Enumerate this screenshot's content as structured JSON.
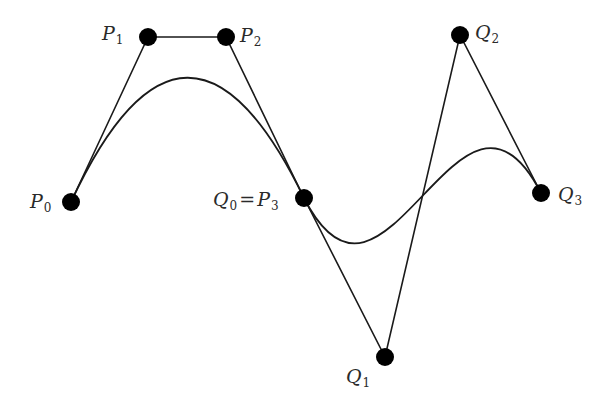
{
  "diagram": {
    "type": "composite-bezier-curve",
    "stroke_color": "#1a1a1a",
    "point_color": "#000000",
    "point_radius": 9,
    "curve_P": {
      "name": "P",
      "control_points": [
        {
          "id": "P0",
          "letter": "P",
          "sub": "0",
          "x": 71,
          "y": 202
        },
        {
          "id": "P1",
          "letter": "P",
          "sub": "1",
          "x": 148,
          "y": 37
        },
        {
          "id": "P2",
          "letter": "P",
          "sub": "2",
          "x": 226,
          "y": 37
        },
        {
          "id": "P3",
          "letter": "P",
          "sub": "3",
          "x": 304,
          "y": 198
        }
      ]
    },
    "curve_Q": {
      "name": "Q",
      "control_points": [
        {
          "id": "Q0",
          "letter": "Q",
          "sub": "0",
          "x": 304,
          "y": 198
        },
        {
          "id": "Q1",
          "letter": "Q",
          "sub": "1",
          "x": 385,
          "y": 357
        },
        {
          "id": "Q2",
          "letter": "Q",
          "sub": "2",
          "x": 460,
          "y": 35
        },
        {
          "id": "Q3",
          "letter": "Q",
          "sub": "3",
          "x": 541,
          "y": 193
        }
      ]
    },
    "labels": {
      "P0": {
        "letter": "P",
        "sub": "0"
      },
      "P1": {
        "letter": "P",
        "sub": "1"
      },
      "P2": {
        "letter": "P",
        "sub": "2"
      },
      "Q0P3": {
        "letter_a": "Q",
        "sub_a": "0",
        "eq": "=",
        "letter_b": "P",
        "sub_b": "3"
      },
      "Q1": {
        "letter": "Q",
        "sub": "1"
      },
      "Q2": {
        "letter": "Q",
        "sub": "2"
      },
      "Q3": {
        "letter": "Q",
        "sub": "3"
      }
    }
  }
}
